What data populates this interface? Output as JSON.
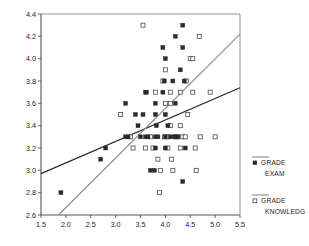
{
  "chart_data": {
    "type": "scatter",
    "title": "",
    "xlabel": "",
    "ylabel": "",
    "xlim": [
      1.5,
      5.5
    ],
    "ylim": [
      2.6,
      4.4
    ],
    "xticks": [
      "1.5",
      "2.0",
      "2.5",
      "3.0",
      "3.5",
      "4.0",
      "4.5",
      "5.0",
      "5.5"
    ],
    "xtick_values": [
      1.5,
      2.0,
      2.5,
      3.0,
      3.5,
      4.0,
      4.5,
      5.0,
      5.5
    ],
    "yticks": [
      "2.6",
      "2.8",
      "3.0",
      "3.2",
      "3.4",
      "3.6",
      "3.8",
      "4.0",
      "4.2",
      "4.4"
    ],
    "ytick_values": [
      2.6,
      2.8,
      3.0,
      3.2,
      3.4,
      3.6,
      3.8,
      4.0,
      4.2,
      4.4
    ],
    "grid": false,
    "legend_position": "right",
    "series": [
      {
        "name": "GRADE EXAM",
        "marker": "filled-square",
        "color": "#2b2b2b",
        "points": [
          [
            1.9,
            2.8
          ],
          [
            2.7,
            3.1
          ],
          [
            2.8,
            3.2
          ],
          [
            3.2,
            3.6
          ],
          [
            3.2,
            3.3
          ],
          [
            3.25,
            3.3
          ],
          [
            3.4,
            3.5
          ],
          [
            3.45,
            3.4
          ],
          [
            3.5,
            3.3
          ],
          [
            3.55,
            3.5
          ],
          [
            3.6,
            3.7
          ],
          [
            3.62,
            3.7
          ],
          [
            3.6,
            3.3
          ],
          [
            3.65,
            3.3
          ],
          [
            3.7,
            3.0
          ],
          [
            3.78,
            3.0
          ],
          [
            3.8,
            3.6
          ],
          [
            3.8,
            3.5
          ],
          [
            3.82,
            3.4
          ],
          [
            3.8,
            3.3
          ],
          [
            3.85,
            3.3
          ],
          [
            3.8,
            3.2
          ],
          [
            3.95,
            4.1
          ],
          [
            3.95,
            3.7
          ],
          [
            3.98,
            3.8
          ],
          [
            4.0,
            4.0
          ],
          [
            4.0,
            3.5
          ],
          [
            4.0,
            3.3
          ],
          [
            4.0,
            3.2
          ],
          [
            4.05,
            3.4
          ],
          [
            4.1,
            3.3
          ],
          [
            4.15,
            3.8
          ],
          [
            4.18,
            3.3
          ],
          [
            4.2,
            4.2
          ],
          [
            4.2,
            3.6
          ],
          [
            4.25,
            3.3
          ],
          [
            4.3,
            3.9
          ],
          [
            4.35,
            4.3
          ],
          [
            4.35,
            4.1
          ],
          [
            4.38,
            3.8
          ],
          [
            4.35,
            2.9
          ],
          [
            4.4,
            3.2
          ]
        ]
      },
      {
        "name": "GRADE KNOWLEDG",
        "marker": "open-square",
        "color": "#4a4a4a",
        "points": [
          [
            3.1,
            3.5
          ],
          [
            3.3,
            3.3
          ],
          [
            3.35,
            3.2
          ],
          [
            3.55,
            4.3
          ],
          [
            3.6,
            3.2
          ],
          [
            3.7,
            3.3
          ],
          [
            3.75,
            3.2
          ],
          [
            3.8,
            3.7
          ],
          [
            3.85,
            3.1
          ],
          [
            3.88,
            2.8
          ],
          [
            3.9,
            3.0
          ],
          [
            3.95,
            3.8
          ],
          [
            3.98,
            3.3
          ],
          [
            4.0,
            3.9
          ],
          [
            4.0,
            3.6
          ],
          [
            4.05,
            3.3
          ],
          [
            4.05,
            3.2
          ],
          [
            4.1,
            3.7
          ],
          [
            4.1,
            3.6
          ],
          [
            4.1,
            3.4
          ],
          [
            4.12,
            3.1
          ],
          [
            4.15,
            3.0
          ],
          [
            4.2,
            3.3
          ],
          [
            4.25,
            3.3
          ],
          [
            4.3,
            3.7
          ],
          [
            4.3,
            3.4
          ],
          [
            4.3,
            3.2
          ],
          [
            4.35,
            3.3
          ],
          [
            4.4,
            3.3
          ],
          [
            4.42,
            3.8
          ],
          [
            4.45,
            3.5
          ],
          [
            4.5,
            4.0
          ],
          [
            4.55,
            4.0
          ],
          [
            4.55,
            3.7
          ],
          [
            4.6,
            3.2
          ],
          [
            4.62,
            3.0
          ],
          [
            4.68,
            4.2
          ],
          [
            4.7,
            3.3
          ],
          [
            4.9,
            3.7
          ],
          [
            5.0,
            3.3
          ]
        ]
      }
    ],
    "fit_lines": [
      {
        "name": "GRADE EXAM fit",
        "color": "#2b2b2b",
        "x0": 1.5,
        "y0": 2.97,
        "x1": 5.5,
        "y1": 3.74
      },
      {
        "name": "GRADE KNOWLEDG fit",
        "color": "#8c8c8c",
        "x0": 1.85,
        "y0": 2.6,
        "x1": 5.5,
        "y1": 4.22
      }
    ]
  },
  "legend": {
    "entries": [
      {
        "label_line1": "GRADE",
        "label_line2": "EXAM",
        "marker": "filled-square"
      },
      {
        "label_line1": "GRADE",
        "label_line2": "KNOWLEDG",
        "marker": "open-square"
      }
    ]
  }
}
